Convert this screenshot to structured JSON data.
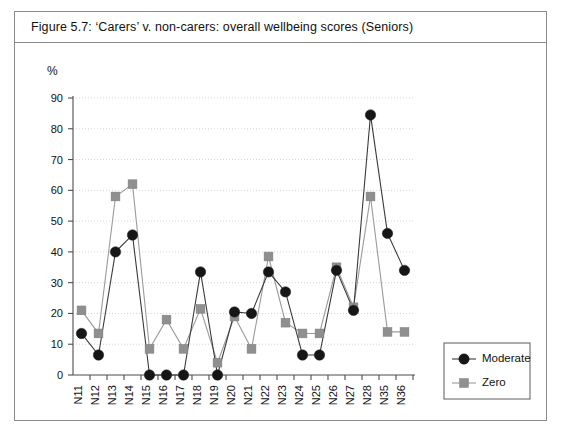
{
  "figure": {
    "caption": "Figure 5.7:  ‘Carers’ v. non-carers: overall wellbeing scores (Seniors)"
  },
  "chart_data": {
    "type": "line",
    "title": "Figure 5.7:  ‘Carers’ v. non-carers: overall wellbeing scores (Seniors)",
    "xlabel": "",
    "ylabel": "%",
    "ylim": [
      0,
      90
    ],
    "ytick_step": 10,
    "yticks": [
      0,
      10,
      20,
      30,
      40,
      50,
      60,
      70,
      80,
      90
    ],
    "grid": true,
    "grid_axis": "y",
    "legend_position": "right",
    "categories": [
      "N11",
      "N12",
      "N13",
      "N14",
      "N15",
      "N16",
      "N17",
      "N18",
      "N19",
      "N20",
      "N21",
      "N22",
      "N23",
      "N24",
      "N25",
      "N26",
      "N27",
      "N28",
      "N35",
      "N36"
    ],
    "series": [
      {
        "name": "Moderate",
        "marker": "circle",
        "color": "#161616",
        "values": [
          13.5,
          6.5,
          40,
          45.5,
          0,
          0,
          0,
          33.5,
          0,
          20.5,
          20,
          33.5,
          27,
          6.5,
          6.5,
          34,
          21,
          84.5,
          46,
          34
        ]
      },
      {
        "name": "Zero",
        "marker": "square",
        "color": "#8f8f8f",
        "values": [
          21,
          13.5,
          58,
          62,
          8.5,
          18,
          8.5,
          21.5,
          4,
          19,
          8.5,
          38.5,
          17,
          13.5,
          13.5,
          35,
          22,
          58,
          14,
          14
        ]
      }
    ]
  },
  "legend": {
    "entries": [
      {
        "label": "Moderate",
        "marker": "circle"
      },
      {
        "label": "Zero",
        "marker": "square"
      }
    ]
  },
  "axis": {
    "y_unit_label": "%"
  },
  "colors": {
    "moderate": "#161616",
    "zero": "#8f8f8f",
    "grid": "#c9c9cf",
    "axis": "#4d4d4d",
    "frame": "#8a8a8a"
  }
}
